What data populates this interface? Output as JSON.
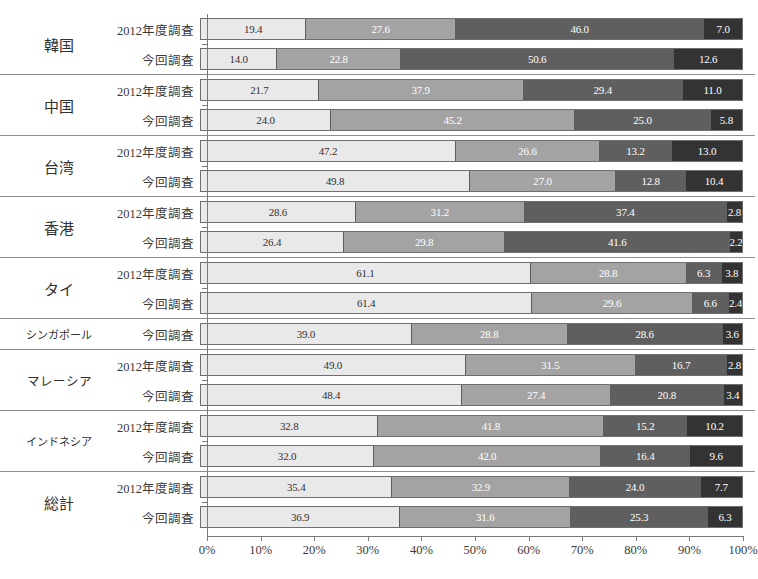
{
  "chart_data": {
    "type": "bar",
    "orientation": "horizontal",
    "stacked": true,
    "stack_mode": "percent",
    "title": "",
    "xlabel": "",
    "ylabel": "",
    "xlim": [
      0,
      100
    ],
    "grid": false,
    "legend_position": "none",
    "xticks": [
      "0%",
      "10%",
      "20%",
      "30%",
      "40%",
      "50%",
      "60%",
      "70%",
      "80%",
      "90%",
      "100%"
    ],
    "xtick_values": [
      0,
      10,
      20,
      30,
      40,
      50,
      60,
      70,
      80,
      90,
      100
    ],
    "series_names": [
      "segment-1",
      "segment-2",
      "segment-3",
      "segment-4"
    ],
    "series_colors": [
      "#e9e9e9",
      "#a3a3a3",
      "#5f5f5f",
      "#333333"
    ],
    "survey_labels": {
      "previous": "2012年度調査",
      "current": "今回調査"
    },
    "groups": [
      {
        "category": "韓国",
        "rows": [
          {
            "label": "2012年度調査",
            "values": [
              19.4,
              27.6,
              46.0,
              7.0
            ]
          },
          {
            "label": "今回調査",
            "values": [
              14.0,
              22.8,
              50.6,
              12.6
            ]
          }
        ]
      },
      {
        "category": "中国",
        "rows": [
          {
            "label": "2012年度調査",
            "values": [
              21.7,
              37.9,
              29.4,
              11.0
            ]
          },
          {
            "label": "今回調査",
            "values": [
              24.0,
              45.2,
              25.0,
              5.8
            ]
          }
        ]
      },
      {
        "category": "台湾",
        "rows": [
          {
            "label": "2012年度調査",
            "values": [
              47.2,
              26.6,
              13.2,
              13.0
            ]
          },
          {
            "label": "今回調査",
            "values": [
              49.8,
              27.0,
              12.8,
              10.4
            ]
          }
        ]
      },
      {
        "category": "香港",
        "rows": [
          {
            "label": "2012年度調査",
            "values": [
              28.6,
              31.2,
              37.4,
              2.8
            ]
          },
          {
            "label": "今回調査",
            "values": [
              26.4,
              29.8,
              41.6,
              2.2
            ]
          }
        ]
      },
      {
        "category": "タイ",
        "rows": [
          {
            "label": "2012年度調査",
            "values": [
              61.1,
              28.8,
              6.3,
              3.8
            ]
          },
          {
            "label": "今回調査",
            "values": [
              61.4,
              29.6,
              6.6,
              2.4
            ]
          }
        ]
      },
      {
        "category": "シンガポール",
        "rows": [
          {
            "label": "今回調査",
            "values": [
              39.0,
              28.8,
              28.6,
              3.6
            ]
          }
        ]
      },
      {
        "category": "マレーシア",
        "rows": [
          {
            "label": "2012年度調査",
            "values": [
              49.0,
              31.5,
              16.7,
              2.8
            ]
          },
          {
            "label": "今回調査",
            "values": [
              48.4,
              27.4,
              20.8,
              3.4
            ]
          }
        ]
      },
      {
        "category": "インドネシア",
        "rows": [
          {
            "label": "2012年度調査",
            "values": [
              32.8,
              41.8,
              15.2,
              10.2
            ]
          },
          {
            "label": "今回調査",
            "values": [
              32.0,
              42.0,
              16.4,
              9.6
            ]
          }
        ]
      },
      {
        "category": "総計",
        "rows": [
          {
            "label": "2012年度調査",
            "values": [
              35.4,
              32.9,
              24.0,
              7.7
            ]
          },
          {
            "label": "今回調査",
            "values": [
              36.9,
              31.6,
              25.3,
              6.3
            ]
          }
        ]
      }
    ]
  }
}
